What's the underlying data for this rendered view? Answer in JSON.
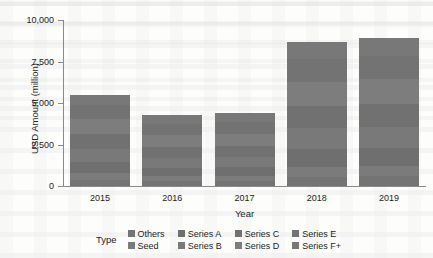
{
  "chart_data": {
    "type": "bar",
    "title": "",
    "subtitle": "",
    "xlabel": "Year",
    "ylabel": "USD Amount (million)",
    "categories": [
      "2015",
      "2016",
      "2017",
      "2018",
      "2019"
    ],
    "ylim": [
      0,
      10000
    ],
    "yticks": [
      0,
      2500,
      5000,
      7500,
      10000
    ],
    "ytick_labels": [
      "0",
      "2,500",
      "5,000",
      "7,500",
      "10,000"
    ],
    "grid": false,
    "stacked": true,
    "legend_title": "Type",
    "legend_position": "bottom",
    "series": [
      {
        "name": "Others",
        "color": "#747474",
        "values": [
          360,
          280,
          290,
          570,
          600
        ]
      },
      {
        "name": "Seed",
        "color": "#7b7b7b",
        "values": [
          400,
          300,
          310,
          600,
          620
        ]
      },
      {
        "name": "Series A",
        "color": "#6f6f6f",
        "values": [
          700,
          520,
          540,
          1050,
          1080
        ]
      },
      {
        "name": "Series B",
        "color": "#797979",
        "values": [
          800,
          610,
          620,
          1250,
          1280
        ]
      },
      {
        "name": "Series C",
        "color": "#717171",
        "values": [
          850,
          660,
          670,
          1350,
          1380
        ]
      },
      {
        "name": "Series D",
        "color": "#7d7d7d",
        "values": [
          900,
          700,
          710,
          1430,
          1460
        ]
      },
      {
        "name": "Series E",
        "color": "#737373",
        "values": [
          880,
          690,
          700,
          1400,
          1430
        ]
      },
      {
        "name": "Series F+",
        "color": "#787878",
        "values": [
          610,
          540,
          560,
          1050,
          1050
        ]
      }
    ],
    "totals": [
      5500,
      4300,
      4400,
      8700,
      8900
    ],
    "legend_columns": [
      [
        "Others",
        "Seed"
      ],
      [
        "Series A",
        "Series B"
      ],
      [
        "Series C",
        "Series D"
      ],
      [
        "Series E",
        "Series F+"
      ]
    ]
  },
  "colors": {
    "bar_gray": "#757575",
    "axis": "#8a8a8a",
    "text": "#1d1d1d",
    "background": "#fdfdfc"
  }
}
